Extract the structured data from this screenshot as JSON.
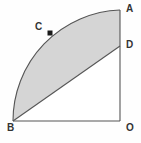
{
  "figure": {
    "background_color": "#fefefe",
    "shaded_fill_color": "#d5d5d5",
    "stroke_color": "#555555",
    "label_color": "#333333",
    "marker": {
      "name": "point-c-marker",
      "shape": "filled-square",
      "color": "#1a1a1a",
      "x": 50,
      "y": 33,
      "size": 5
    },
    "geometry": {
      "center": {
        "label": "O",
        "x": 120,
        "y": 121
      },
      "radius": 111,
      "arc_start": {
        "label": "A",
        "x": 120,
        "y": 10
      },
      "arc_end": {
        "label": "B",
        "x": 13,
        "y": 121
      },
      "segment_point": {
        "label": "D",
        "x": 120,
        "y": 46
      },
      "arc_point": {
        "label": "C",
        "x": 50,
        "y": 33
      },
      "arc_path": "M 120 10 A 111 111 0 0 0 13 121",
      "shaded_path": "M 120 10 A 111 111 0 0 0 13 121 L 120 46 Z",
      "triangle_path": "M 13 121 L 120 46 L 120 121 Z",
      "bottom_edge": {
        "x1": 13,
        "y1": 121,
        "x2": 120,
        "y2": 121
      },
      "right_edge": {
        "x1": 120,
        "y1": 10,
        "x2": 120,
        "y2": 121
      },
      "chord_bd": {
        "x1": 13,
        "y1": 121,
        "x2": 120,
        "y2": 46
      }
    },
    "labels": [
      {
        "id": "A",
        "text": "A",
        "name": "vertex-label-a"
      },
      {
        "id": "D",
        "text": "D",
        "name": "vertex-label-d"
      },
      {
        "id": "O",
        "text": "O",
        "name": "vertex-label-o"
      },
      {
        "id": "B",
        "text": "B",
        "name": "vertex-label-b"
      },
      {
        "id": "C",
        "text": "C",
        "name": "vertex-label-c"
      }
    ]
  }
}
